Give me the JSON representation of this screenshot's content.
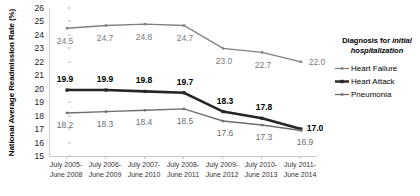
{
  "chart_data": {
    "type": "line",
    "title": "",
    "xlabel": "",
    "ylabel": "National Average Readmission Rate (%)",
    "ylim": [
      15,
      26
    ],
    "yticks": [
      15,
      16,
      17,
      18,
      19,
      20,
      21,
      22,
      23,
      24,
      25,
      26
    ],
    "grid": false,
    "legend_position": "right",
    "legend_title_line1": "Diagnosis for ",
    "legend_title_em": "initial",
    "legend_title_line2": "hospitalization",
    "categories": [
      "July 2005-\nJune 2008",
      "July 2006-\nJune 2009",
      "July 2007-\nJune 2010",
      "July 2008-\nJune 2011",
      "July 2009-\nJune 2012",
      "July 2010-\nJune 2013",
      "July 2011-\nJune 2014"
    ],
    "categories_line1": [
      "July 2005-",
      "July 2006-",
      "July 2007-",
      "July 2008-",
      "July 2009-",
      "July 2010-",
      "July 2011-"
    ],
    "categories_line2": [
      "June 2008",
      "June 2009",
      "June 2010",
      "June 2011",
      "June 2012",
      "June 2013",
      "June 2014"
    ],
    "series": [
      {
        "name": "Heart Failure",
        "color": "#808080",
        "values": [
          24.5,
          24.7,
          24.8,
          24.7,
          23.0,
          22.7,
          22.0
        ],
        "labels": [
          "24.5",
          "24.7",
          "24.8",
          "24.7",
          "23.0",
          "22.7",
          "22.0"
        ]
      },
      {
        "name": "Heart Attack",
        "color": "#262626",
        "values": [
          19.9,
          19.9,
          19.8,
          19.7,
          18.3,
          17.8,
          17.0
        ],
        "labels": [
          "19.9",
          "19.9",
          "19.8",
          "19.7",
          "18.3",
          "17.8",
          "17.0"
        ]
      },
      {
        "name": "Pneumonia",
        "color": "#6e6e6e",
        "values": [
          18.2,
          18.3,
          18.4,
          18.5,
          17.6,
          17.3,
          16.9
        ],
        "labels": [
          "18.2",
          "18.3",
          "18.4",
          "18.5",
          "17.6",
          "17.3",
          "16.9"
        ]
      }
    ]
  },
  "legend": {
    "items": [
      {
        "label": "Heart Failure"
      },
      {
        "label": "Heart Attack"
      },
      {
        "label": "Pneumonia"
      }
    ]
  }
}
